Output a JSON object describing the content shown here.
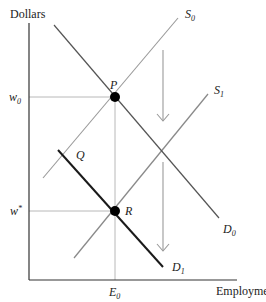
{
  "diagram": {
    "type": "labor supply and demand shift",
    "axes": {
      "y_label": "Dollars",
      "x_label": "Employment"
    },
    "ticks": {
      "w0": {
        "base": "w",
        "sub": "0"
      },
      "w_star": {
        "base": "w",
        "sup": "*"
      },
      "E0": {
        "base": "E",
        "sub": "0"
      }
    },
    "curves": {
      "S0": {
        "base": "S",
        "sub": "0"
      },
      "S1": {
        "base": "S",
        "sub": "1"
      },
      "D0": {
        "base": "D",
        "sub": "0"
      },
      "D1": {
        "base": "D",
        "sub": "1"
      }
    },
    "points": {
      "P": "P",
      "Q": "Q",
      "R": "R"
    },
    "colors": {
      "axis": "#333333",
      "curve": "#555555",
      "supply": "#8a8a8a",
      "bold_demand": "#1a1a1a",
      "guide": "#b0b0b0",
      "arrow": "#9a9a9a",
      "point": "#000000"
    }
  }
}
